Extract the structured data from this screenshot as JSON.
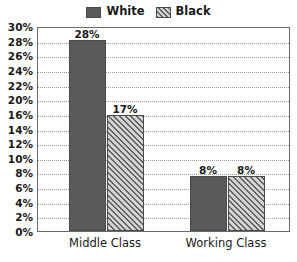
{
  "chart_data": {
    "type": "bar",
    "title": "",
    "subtitle": "",
    "xlabel": "",
    "ylabel": "",
    "categories": [
      "Middle Class",
      "Working Class"
    ],
    "series": [
      {
        "name": "White",
        "values": [
          28,
          17
        ],
        "value_labels": [
          "28%",
          "17%"
        ],
        "fill": "solid",
        "color": "#5a5a5a"
      },
      {
        "name": "Black",
        "values": [
          17,
          8
        ],
        "value_labels": [
          "17%",
          "8%"
        ],
        "fill": "hatch",
        "color": "#d2d2d2"
      }
    ],
    "grouped_values": [
      {
        "category": "Middle Class",
        "White": 28,
        "Black": 17
      },
      {
        "category": "Working Class",
        "White": 8,
        "Black": 8
      }
    ],
    "bars": [
      {
        "category": "Middle Class",
        "series": "White",
        "value": 28,
        "label": "28%"
      },
      {
        "category": "Middle Class",
        "series": "Black",
        "value": 17,
        "label": "17%"
      },
      {
        "category": "Working Class",
        "series": "White",
        "value": 8,
        "label": "8%"
      },
      {
        "category": "Working Class",
        "series": "Black",
        "value": 8,
        "label": "8%"
      }
    ],
    "ylim": [
      0,
      30
    ],
    "y_tick_values": [
      30,
      28,
      26,
      24,
      22,
      20,
      18,
      16,
      14,
      12,
      10,
      8,
      6,
      4,
      2,
      0
    ],
    "y_tick_labels": [
      "30%",
      "28%",
      "26%",
      "24%",
      "22%",
      "20%",
      "16%",
      "14%",
      "12%",
      "10%",
      "8%",
      "6%",
      "4%",
      "2%",
      "0%"
    ],
    "grid": true,
    "grid_style": "dotted",
    "legend_position": "top-center"
  },
  "legend": {
    "entries": [
      {
        "label": "White",
        "swatch": "solid-gray-swatch"
      },
      {
        "label": "Black",
        "swatch": "diagonal-hatch-swatch"
      }
    ]
  },
  "colors": {
    "white_series": "#5a5a5a",
    "black_series_background": "#d2d2d2",
    "black_series_hatch": "#606060",
    "axis": "#6b6b6b",
    "gridline": "#9a9a9a",
    "text": "#1a1a1a"
  }
}
